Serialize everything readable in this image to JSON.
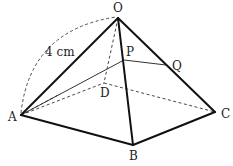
{
  "diagram": {
    "type": "square pyramid",
    "vertices": {
      "O": "O",
      "A": "A",
      "B": "B",
      "C": "C",
      "D": "D",
      "P": "P",
      "Q": "Q"
    },
    "edge_label": "4 cm",
    "edges": {
      "visible": [
        "OA",
        "OB",
        "OC",
        "AB",
        "BC"
      ],
      "hidden": [
        "OD",
        "AD",
        "DC"
      ],
      "section": [
        "AP",
        "PQ"
      ],
      "hidden_section": [],
      "arc": "OA"
    }
  }
}
